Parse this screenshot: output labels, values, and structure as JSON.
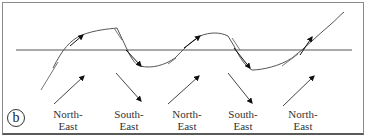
{
  "panel_label": "b",
  "wind_labels": [
    {
      "line1": "North-",
      "line2": "East"
    },
    {
      "line1": "South-",
      "line2": "East"
    },
    {
      "line1": "North-",
      "line2": "East"
    },
    {
      "line1": "South-",
      "line2": "East"
    },
    {
      "line1": "North-",
      "line2": "East"
    }
  ],
  "colors": {
    "line": "#555555",
    "arrow": "#111111",
    "text": "#333333",
    "border": "#8a8a8a"
  }
}
